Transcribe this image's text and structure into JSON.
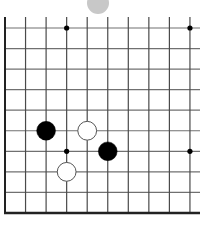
{
  "board": {
    "view": "bottom-left corner",
    "visible_columns": 10,
    "visible_rows": 10,
    "grid": {
      "origin_x": 5,
      "origin_y": 28,
      "spacing": 20.55,
      "line_top": 17,
      "line_right_extent": 200,
      "vertical_line_color": "#4a4a4a",
      "horizontal_line_color": "#707070",
      "edge_color": "#222222",
      "has_left_edge": true,
      "has_bottom_edge": true
    },
    "star_points": [
      {
        "col": 3,
        "row": 0
      },
      {
        "col": 9,
        "row": 0
      },
      {
        "col": 3,
        "row": 6
      },
      {
        "col": 9,
        "row": 6
      }
    ],
    "stones": [
      {
        "color": "black",
        "col": 2,
        "row": 5
      },
      {
        "color": "white",
        "col": 4,
        "row": 5
      },
      {
        "color": "black",
        "col": 5,
        "row": 6
      },
      {
        "color": "white",
        "col": 3,
        "row": 7
      }
    ],
    "ghost_stone": {
      "cx": 98,
      "cy": 3,
      "r": 11,
      "color": "#c8c8c8"
    },
    "colors": {
      "black_stone": "#000000",
      "white_stone_fill": "#ffffff",
      "white_stone_stroke": "#555555",
      "star_point": "#000000",
      "background": "#ffffff"
    }
  }
}
